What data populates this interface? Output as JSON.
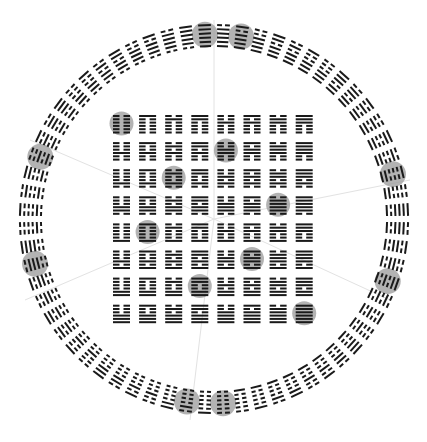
{
  "diagram": {
    "title": "Fu Xi arrangement of the 64 hexagrams (circle and square)",
    "colors": {
      "background": "#ffffff",
      "line": "#1a1a1a",
      "highlight": "#9a9a9a",
      "radial": "#e2e2e2"
    },
    "center": {
      "x": 214,
      "y": 219
    },
    "ring": {
      "count": 64,
      "inner_radius": 173,
      "line_pitch": 4.2,
      "line_length": 11,
      "line_thickness": 2,
      "start_angle_deg": 0,
      "highlight_slots": [
        0,
        2,
        14,
        20,
        32,
        34,
        46,
        52
      ],
      "highlight_radius": 13
    },
    "square": {
      "rows": 8,
      "cols": 8,
      "origin_x": 113,
      "origin_y": 115,
      "pitch_x": 26.1,
      "pitch_y": 27.1,
      "cell_width": 17,
      "line_pitch": 3.3,
      "line_thickness": 2,
      "highlight_cells": [
        [
          0,
          0
        ],
        [
          1,
          4
        ],
        [
          2,
          2
        ],
        [
          3,
          6
        ],
        [
          4,
          1
        ],
        [
          5,
          5
        ],
        [
          6,
          3
        ],
        [
          7,
          7
        ]
      ],
      "highlight_radius": 12
    },
    "radial_lines": [
      {
        "x": 214,
        "y": 20
      },
      {
        "x": 410,
        "y": 180
      },
      {
        "x": 390,
        "y": 300
      },
      {
        "x": 190,
        "y": 420
      },
      {
        "x": 25,
        "y": 300
      },
      {
        "x": 30,
        "y": 140
      }
    ]
  }
}
